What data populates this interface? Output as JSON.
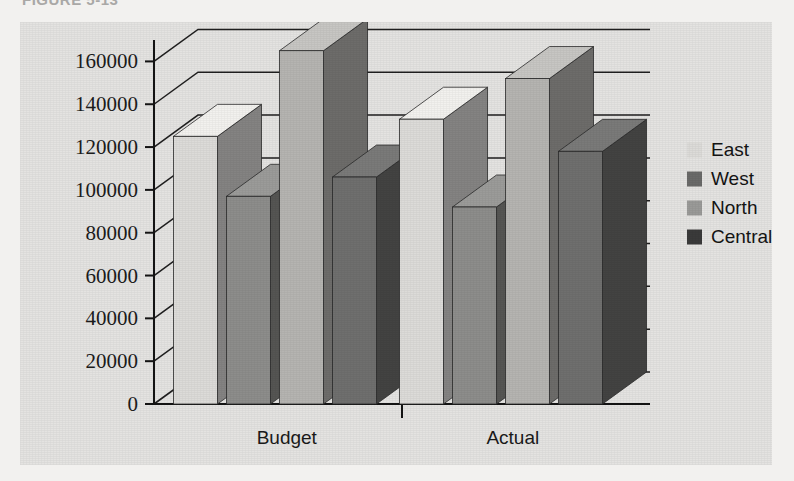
{
  "figure": {
    "caption": "FIGURE 5-13"
  },
  "chart_data": {
    "type": "bar",
    "title": "",
    "xlabel": "",
    "ylabel": "",
    "categories": [
      "Budget",
      "Actual"
    ],
    "series": [
      {
        "name": "East",
        "color": "#dcdbd8",
        "values": [
          125000,
          133000
        ]
      },
      {
        "name": "West",
        "color": "#8d8d8b",
        "values": [
          97000,
          92000
        ]
      },
      {
        "name": "North",
        "color": "#b5b4b1",
        "values": [
          165000,
          152000
        ]
      },
      {
        "name": "Central",
        "color": "#6f6f6e",
        "values": [
          106000,
          118000
        ]
      }
    ],
    "ylim": [
      0,
      170000
    ],
    "yticks": [
      0,
      20000,
      40000,
      60000,
      80000,
      100000,
      120000,
      140000,
      160000
    ],
    "ytick_labels": [
      "0",
      "20000",
      "40000",
      "60000",
      "80000",
      "100000",
      "120000",
      "140000",
      "160000"
    ],
    "grid": true,
    "legend_position": "right",
    "three_d": true,
    "plot_background": "#e4e3e1",
    "axis_color": "#1a1a1a"
  },
  "legend": {
    "items": [
      {
        "label": "East",
        "swatch": "#dcdbd8"
      },
      {
        "label": "West",
        "swatch": "#6a6a69"
      },
      {
        "label": "North",
        "swatch": "#9a9a98"
      },
      {
        "label": "Central",
        "swatch": "#3a3a3a"
      }
    ]
  }
}
